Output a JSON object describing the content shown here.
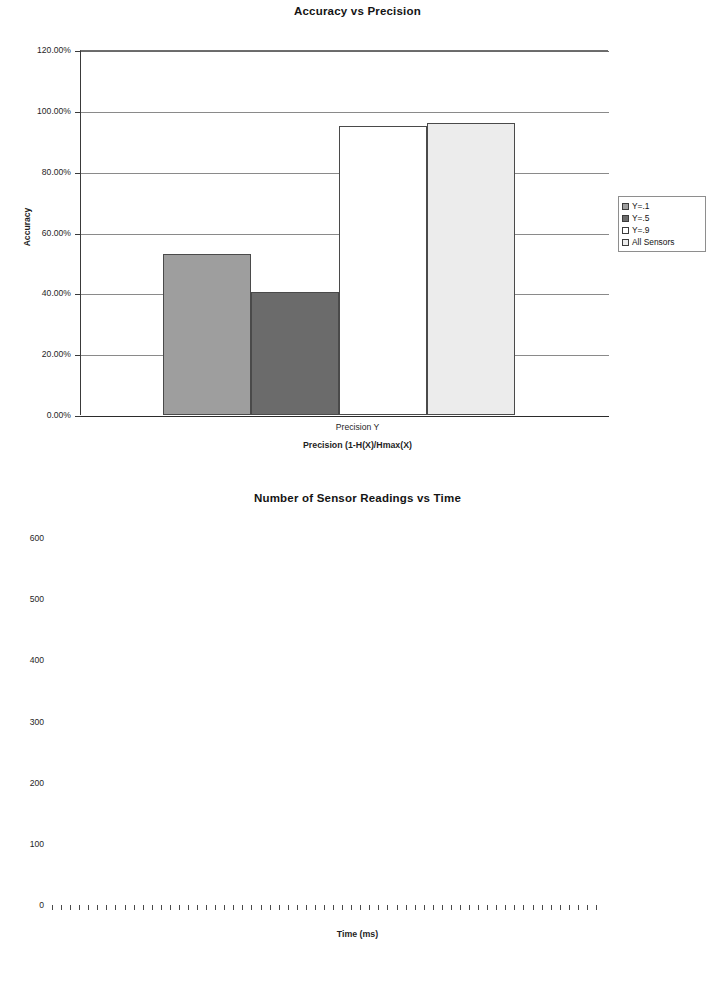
{
  "charts": [
    {
      "id": "accuracy-vs-precision",
      "title": "Accuracy vs Precision",
      "ylabel": "Accuracy",
      "xcaption": "Precision Y",
      "xtitle": "Precision (1-H(X)/Hmax(X)",
      "yticks": [
        "0.00%",
        "20.00%",
        "40.00%",
        "60.00%",
        "80.00%",
        "100.00%",
        "120.00%"
      ],
      "legend": [
        {
          "label": "Y=.1",
          "color": "#9e9e9e"
        },
        {
          "label": "Y=.5",
          "color": "#6b6b6b"
        },
        {
          "label": "Y=.9",
          "color": "#ffffff"
        },
        {
          "label": "All Sensors",
          "color": "#ececec"
        }
      ]
    },
    {
      "id": "readings-vs-time",
      "title": "Number of Sensor Readings vs Time",
      "xtitle": "Time (ms)",
      "yticks": [
        "0",
        "100",
        "200",
        "300",
        "400",
        "500",
        "600"
      ],
      "legend": [
        {
          "label": "Y=.1",
          "color": "#1d1d1d",
          "marker": "diamond"
        },
        {
          "label": "Y=.5",
          "color": "#a8a8a8",
          "marker": "square"
        },
        {
          "label": "Y=.9",
          "color": "#8c8c8c",
          "marker": "triangle"
        },
        {
          "label": "All Sensors",
          "color": "#c9c9c9",
          "marker": "cross"
        }
      ]
    }
  ],
  "chart_data": [
    {
      "type": "bar",
      "title": "Accuracy vs Precision",
      "xlabel": "Precision (1-H(X)/Hmax(X)",
      "ylabel": "Accuracy",
      "categories": [
        "Y=.1",
        "Y=.5",
        "Y=.9",
        "All Sensors"
      ],
      "values": [
        52.8,
        40.6,
        95.0,
        96.0
      ],
      "value_format": "percent",
      "ylim": [
        0,
        120
      ],
      "ytick_values": [
        0,
        20,
        40,
        60,
        80,
        100,
        120
      ],
      "ytick_labels": [
        "0.00%",
        "20.00%",
        "40.00%",
        "60.00%",
        "80.00%",
        "100.00%",
        "120.00%"
      ],
      "series_colors": [
        "#9e9e9e",
        "#6b6b6b",
        "#ffffff",
        "#ececec"
      ],
      "grid": true,
      "legend_position": "right",
      "category_axis_caption": "Precision Y"
    },
    {
      "type": "line",
      "title": "Number of Sensor Readings vs Time",
      "xlabel": "Time (ms)",
      "ylabel": "",
      "ylim": [
        0,
        600
      ],
      "ytick_values": [
        0,
        100,
        200,
        300,
        400,
        500,
        600
      ],
      "ytick_labels": [
        "0",
        "100",
        "200",
        "300",
        "400",
        "500",
        "600"
      ],
      "xlim": [
        0,
        60
      ],
      "xtick_count": 60,
      "grid": true,
      "legend_position": "right",
      "series": [
        {
          "name": "Y=.1",
          "color": "#1d1d1d",
          "marker": "diamond",
          "x": [
            14,
            15,
            16,
            17,
            18,
            19,
            20
          ],
          "values": [
            22,
            22,
            23,
            24,
            25,
            26,
            27
          ]
        },
        {
          "name": "Y=.5",
          "color": "#a8a8a8",
          "marker": "square",
          "x": [
            0,
            1,
            2,
            3,
            4,
            5,
            6,
            7,
            8,
            9,
            10,
            11,
            12,
            13,
            14,
            15,
            16,
            17,
            18,
            19,
            20,
            21,
            22,
            23,
            24,
            25,
            26,
            27,
            28,
            29,
            30,
            31,
            32,
            33,
            34,
            35,
            36,
            37,
            38,
            39,
            40,
            41,
            42,
            43,
            44,
            45,
            46,
            47,
            48,
            49,
            50,
            51,
            52,
            53,
            54,
            55,
            56,
            57,
            58,
            59
          ],
          "values": [
            7,
            9,
            10,
            11,
            12,
            13,
            14,
            15,
            16,
            17,
            18,
            19,
            20,
            24,
            27,
            29,
            30,
            33,
            35,
            36,
            37,
            38,
            39,
            40,
            41,
            42,
            43,
            44,
            45,
            45,
            46,
            48,
            50,
            52,
            53,
            55,
            56,
            57,
            58,
            59,
            60,
            61,
            62,
            63,
            64,
            66,
            67,
            68,
            69,
            70,
            71,
            72,
            73,
            74,
            75,
            76,
            77,
            78,
            79,
            82
          ]
        },
        {
          "name": "Y=.9",
          "color": "#8c8c8c",
          "marker": "triangle",
          "x": [
            0,
            1,
            2,
            3,
            4,
            5,
            6,
            7,
            8,
            9,
            10,
            11,
            12,
            13,
            14,
            15,
            16,
            17,
            18,
            19,
            20,
            21,
            22,
            23,
            24,
            25,
            26,
            27,
            28,
            29,
            30,
            31,
            32,
            33,
            34,
            35,
            36,
            37,
            38,
            39,
            40,
            41,
            42,
            43,
            44,
            45,
            46,
            47,
            48,
            49,
            50,
            51,
            52,
            53,
            54,
            55,
            56,
            57,
            58,
            59
          ],
          "values": [
            9,
            12,
            15,
            18,
            21,
            23,
            25,
            27,
            29,
            31,
            33,
            35,
            37,
            39,
            41,
            43,
            45,
            47,
            49,
            55,
            68,
            78,
            85,
            90,
            97,
            108,
            110,
            111,
            112,
            113,
            119,
            126,
            133,
            140,
            148,
            155,
            160,
            166,
            168,
            170,
            176,
            185,
            196,
            205,
            213,
            222,
            228,
            238,
            248,
            258,
            268,
            275,
            279,
            281,
            283,
            284,
            285,
            286,
            287,
            288
          ]
        },
        {
          "name": "All Sensors",
          "color": "#c9c9c9",
          "marker": "cross",
          "x": [
            0,
            1,
            2,
            3,
            4,
            5,
            6,
            7,
            8,
            9,
            10,
            11,
            12,
            13,
            14,
            15,
            16,
            17,
            18,
            19,
            20,
            21,
            22,
            23,
            24,
            25,
            26,
            27,
            28,
            29,
            30,
            31,
            32,
            33,
            34,
            35,
            36,
            37,
            38,
            39,
            40,
            41,
            42,
            43,
            44,
            45,
            46,
            47
          ],
          "values": [
            8,
            20,
            32,
            44,
            56,
            68,
            80,
            92,
            104,
            116,
            128,
            140,
            152,
            164,
            176,
            188,
            200,
            212,
            224,
            236,
            248,
            260,
            272,
            284,
            296,
            308,
            320,
            332,
            344,
            356,
            368,
            380,
            392,
            404,
            416,
            428,
            440,
            452,
            464,
            476,
            488,
            500,
            512,
            524,
            536,
            548,
            560,
            570
          ]
        }
      ]
    }
  ]
}
